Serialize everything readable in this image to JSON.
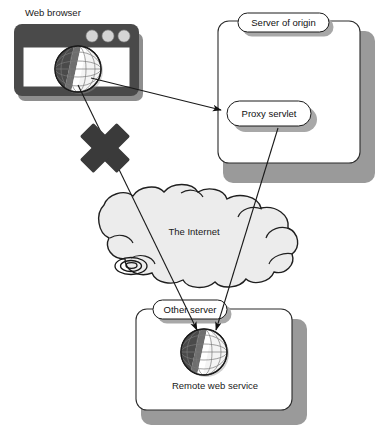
{
  "diagram": {
    "nodes": {
      "web_browser_label": "Web browser",
      "server_of_origin_label": "Server of origin",
      "proxy_servlet_label": "Proxy servlet",
      "internet_label": "The Internet",
      "other_server_label": "Other server",
      "remote_web_service_label": "Remote web service"
    },
    "icons": {
      "browser_globe": "globe-icon",
      "remote_globe": "globe-icon",
      "blocked_marker": "x-cross-icon",
      "internet_cloud": "cloud-icon",
      "spiral_detail": "spiral-icon",
      "browser_window": "browser-window-icon"
    },
    "colors": {
      "cloud_fill": "#ececec",
      "cloud_stroke": "#1f1f1f",
      "browser_frame": "#4a4a4a",
      "browser_dot": "#d4d4d4",
      "box_stroke": "#2b2b2b",
      "box_shadow": "#9a9a9a",
      "line": "#1a1a1a",
      "x_mark": "#3a3a3a",
      "globe_dark": "#4f4f4f",
      "globe_light": "#f2f2f2",
      "page_background": "#ffffff"
    },
    "connections": [
      {
        "id": "browser-to-proxy",
        "from": "Web browser globe",
        "to": "Proxy servlet",
        "arrow": "end",
        "blocked": false
      },
      {
        "id": "browser-to-remote-blocked",
        "from": "Web browser globe",
        "to": "Remote web service globe",
        "arrow": "end",
        "blocked": true,
        "blocked_marker": "x-cross-icon"
      },
      {
        "id": "proxy-to-remote",
        "from": "Proxy servlet",
        "to": "Remote web service globe",
        "arrow": "end",
        "blocked": false
      }
    ]
  }
}
